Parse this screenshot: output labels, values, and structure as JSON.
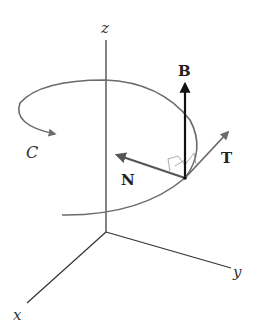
{
  "diagram": {
    "type": "frenet-serret-frame",
    "axes": {
      "z": "z",
      "x": "x",
      "y": "y"
    },
    "curve": {
      "label": "C"
    },
    "vectors": {
      "binormal": "B",
      "normal": "N",
      "tangent": "T"
    },
    "colors": {
      "axes": "#333333",
      "curve": "#6b6b6b",
      "binormal": "#111111",
      "normal": "#555555",
      "tangent": "#6b6b6b"
    }
  }
}
